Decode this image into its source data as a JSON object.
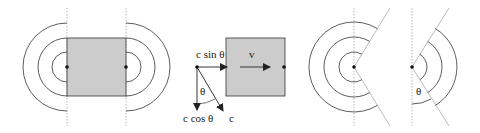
{
  "diagram": {
    "panels": [
      {
        "id": "panel-1",
        "description": "square emitter with semicircular wavefronts on both sides"
      },
      {
        "id": "panel-2",
        "description": "moving square with velocity decomposition"
      },
      {
        "id": "panel-3",
        "description": "point source circular wavefronts with wedge removed"
      },
      {
        "id": "panel-4",
        "description": "wedge of wavefronts with angle theta"
      }
    ],
    "labels": {
      "c_sin": "c sin θ",
      "c_cos": "c cos θ",
      "c": "c",
      "v": "v",
      "theta_panel2": "θ",
      "theta_panel4": "θ"
    },
    "colors": {
      "stroke": "#333333",
      "fill": "#cccccc",
      "guide": "#888888"
    }
  }
}
